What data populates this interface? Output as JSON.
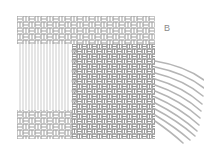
{
  "figure": {
    "label": "B",
    "colors": {
      "thread_outline": "#9a9a9a",
      "thread_fill": "#ffffff",
      "warp_line": "#a8a8a8",
      "loose_thread": "#b5b5b5"
    },
    "regions": {
      "fabric": {
        "x": 17,
        "y": 16,
        "w": 138,
        "h": 123
      },
      "unwoven_warp": {
        "x": 17,
        "y": 44,
        "w": 55,
        "h": 66
      },
      "loose_threads": {
        "count": 11
      }
    }
  }
}
